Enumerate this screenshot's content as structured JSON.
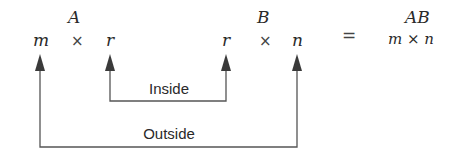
{
  "matrix_a": {
    "name": "A",
    "rows": "m",
    "cols": "r",
    "times": "×"
  },
  "matrix_b": {
    "name": "B",
    "rows": "r",
    "cols": "n",
    "times": "×"
  },
  "equals": "=",
  "product": {
    "name": "AB",
    "dims": "m × n"
  },
  "brackets": {
    "inside_label": "Inside",
    "outside_label": "Outside"
  },
  "colors": {
    "line": "#555555",
    "text": "#2a2a2a"
  }
}
